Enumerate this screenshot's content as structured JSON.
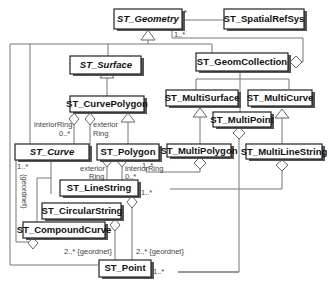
{
  "diagram": {
    "title_fragment": "",
    "classes": {
      "geometry": {
        "name": "ST_Geometry",
        "abstract": true
      },
      "spatialrefsys": {
        "name": "ST_SpatialRefSys",
        "abstract": false
      },
      "surface": {
        "name": "ST_Surface",
        "abstract": true
      },
      "geomcollection": {
        "name": "ST_GeomCollection",
        "abstract": false
      },
      "curvepolygon": {
        "name": "ST_CurvePolygon",
        "abstract": false
      },
      "multisurface": {
        "name": "ST_MultiSurface",
        "abstract": false
      },
      "multicurve": {
        "name": "ST_MultiCurve",
        "abstract": false
      },
      "multipoint": {
        "name": "ST_MultiPoint",
        "abstract": false
      },
      "curve": {
        "name": "ST_Curve",
        "abstract": true
      },
      "polygon": {
        "name": "ST_Polygon",
        "abstract": false
      },
      "multipolygon": {
        "name": "ST_MultiPolygon",
        "abstract": false
      },
      "multilinestring": {
        "name": "ST_MultiLineString",
        "abstract": false
      },
      "linestring": {
        "name": "ST_LineString",
        "abstract": false
      },
      "circularstring": {
        "name": "ST_CircularString",
        "abstract": false
      },
      "compoundcurve": {
        "name": "ST_CompoundCurve",
        "abstract": false
      },
      "point": {
        "name": "ST_Point",
        "abstract": false
      }
    },
    "labels": {
      "geometry_star": "*",
      "geometry_1n": "1..*",
      "cp_interior_1": "interiorRing",
      "cp_interior_2": "0..*",
      "cp_exterior_1": "exterior",
      "cp_exterior_2": "Ring",
      "curve_1n": "1..*",
      "curve_ordered": "{geordnet}",
      "polygon_1n": "1..*",
      "p_exterior_1": "exterior",
      "p_exterior_2": "Ring",
      "p_interior_1": "interiorRing",
      "p_interior_2": "0..*",
      "linestring_1n": "1..*",
      "point_ordered_left": "2..* {geordnet}",
      "point_ordered_right": "2..* {geordnet}",
      "point_1n": "1..*"
    }
  }
}
